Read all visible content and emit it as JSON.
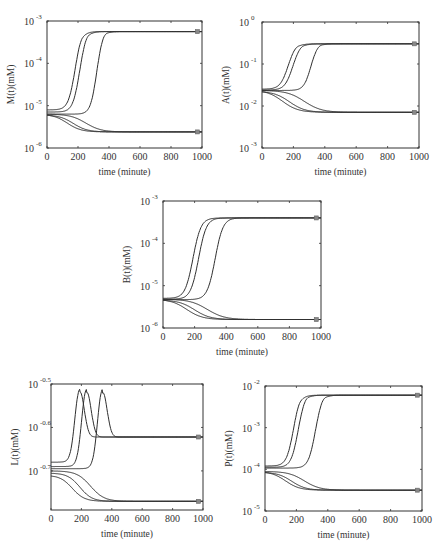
{
  "figure": {
    "width": 439,
    "height": 554,
    "line_color": "#2f2f2f",
    "marker_color": "#888888"
  },
  "chart_data": [
    {
      "id": "M",
      "type": "line",
      "title": "",
      "xlabel": "time (minute)",
      "ylabel": "M(t)(mM)",
      "yscale": "log",
      "xlim": [
        0,
        1000
      ],
      "ylim_log10": [
        -6,
        -3
      ],
      "xticks": [
        0,
        200,
        400,
        600,
        800,
        1000
      ],
      "yticks": [
        {
          "base": "10",
          "exp": "-6",
          "v": -6
        },
        {
          "base": "10",
          "exp": "-5",
          "v": -5
        },
        {
          "base": "10",
          "exp": "-4",
          "v": -4
        },
        {
          "base": "10",
          "exp": "-3",
          "v": -3
        }
      ],
      "box": {
        "x0": 47,
        "y0": 21,
        "x1": 202,
        "y1": 148
      },
      "steady_states_log10": [
        -3.25,
        -5.62
      ],
      "series": [
        {
          "name": "rise-1",
          "start": -5.1,
          "end": -3.25,
          "t_mid": 180,
          "width": 22,
          "overshoot": 0.04,
          "ov_t": 215
        },
        {
          "name": "rise-2",
          "start": -5.15,
          "end": -3.25,
          "t_mid": 210,
          "width": 22,
          "overshoot": 0.04,
          "ov_t": 255
        },
        {
          "name": "rise-3",
          "start": -5.2,
          "end": -3.25,
          "t_mid": 320,
          "width": 20,
          "overshoot": 0.04,
          "ov_t": 370
        },
        {
          "name": "fall-1",
          "start": -5.2,
          "end": -5.62,
          "t_mid": 130,
          "width": 45,
          "overshoot": 0,
          "ov_t": 0
        },
        {
          "name": "fall-2",
          "start": -5.22,
          "end": -5.62,
          "t_mid": 170,
          "width": 45,
          "overshoot": 0,
          "ov_t": 0
        },
        {
          "name": "fall-3",
          "start": -5.2,
          "end": -5.62,
          "t_mid": 250,
          "width": 50,
          "overshoot": 0,
          "ov_t": 0
        }
      ],
      "markers": [
        {
          "t": 970,
          "log10": -3.25
        },
        {
          "t": 970,
          "log10": -5.62
        }
      ]
    },
    {
      "id": "A",
      "type": "line",
      "title": "",
      "xlabel": "time (minute)",
      "ylabel": "A(t)(mM)",
      "yscale": "log",
      "xlim": [
        0,
        1000
      ],
      "ylim_log10": [
        -3,
        0
      ],
      "xticks": [
        0,
        200,
        400,
        600,
        800,
        1000
      ],
      "yticks": [
        {
          "base": "10",
          "exp": "-3",
          "v": -3
        },
        {
          "base": "10",
          "exp": "-2",
          "v": -2
        },
        {
          "base": "10",
          "exp": "-1",
          "v": -1
        },
        {
          "base": "10",
          "exp": "0",
          "v": 0
        }
      ],
      "box": {
        "x0": 262,
        "y0": 22,
        "x1": 419,
        "y1": 148
      },
      "steady_states_log10": [
        -0.52,
        -2.15
      ],
      "series": [
        {
          "name": "rise-1",
          "start": -1.6,
          "end": -0.52,
          "t_mid": 165,
          "width": 25,
          "overshoot": 0.02,
          "ov_t": 215
        },
        {
          "name": "rise-2",
          "start": -1.62,
          "end": -0.52,
          "t_mid": 195,
          "width": 25,
          "overshoot": 0.02,
          "ov_t": 250
        },
        {
          "name": "rise-3",
          "start": -1.63,
          "end": -0.52,
          "t_mid": 310,
          "width": 22,
          "overshoot": 0.02,
          "ov_t": 365
        },
        {
          "name": "fall-1",
          "start": -1.62,
          "end": -2.15,
          "t_mid": 130,
          "width": 50,
          "overshoot": 0,
          "ov_t": 0
        },
        {
          "name": "fall-2",
          "start": -1.65,
          "end": -2.15,
          "t_mid": 175,
          "width": 50,
          "overshoot": 0,
          "ov_t": 0
        },
        {
          "name": "fall-3",
          "start": -1.63,
          "end": -2.15,
          "t_mid": 270,
          "width": 55,
          "overshoot": 0,
          "ov_t": 0
        }
      ],
      "markers": [
        {
          "t": 970,
          "log10": -0.52
        },
        {
          "t": 970,
          "log10": -2.15
        }
      ]
    },
    {
      "id": "B",
      "type": "line",
      "title": "",
      "xlabel": "time (minute)",
      "ylabel": "B(t)(mM)",
      "yscale": "log",
      "xlim": [
        0,
        1000
      ],
      "ylim_log10": [
        -6,
        -3
      ],
      "xticks": [
        0,
        200,
        400,
        600,
        800,
        1000
      ],
      "yticks": [
        {
          "base": "10",
          "exp": "-6",
          "v": -6
        },
        {
          "base": "10",
          "exp": "-5",
          "v": -5
        },
        {
          "base": "10",
          "exp": "-4",
          "v": -4
        },
        {
          "base": "10",
          "exp": "-3",
          "v": -3
        }
      ],
      "box": {
        "x0": 163,
        "y0": 201,
        "x1": 321,
        "y1": 328
      },
      "steady_states_log10": [
        -3.4,
        -5.8
      ],
      "series": [
        {
          "name": "rise-1",
          "start": -5.3,
          "end": -3.4,
          "t_mid": 190,
          "width": 25,
          "overshoot": 0,
          "ov_t": 0
        },
        {
          "name": "rise-2",
          "start": -5.32,
          "end": -3.4,
          "t_mid": 225,
          "width": 25,
          "overshoot": 0,
          "ov_t": 0
        },
        {
          "name": "rise-3",
          "start": -5.33,
          "end": -3.4,
          "t_mid": 330,
          "width": 25,
          "overshoot": 0,
          "ov_t": 0
        },
        {
          "name": "fall-1",
          "start": -5.32,
          "end": -5.8,
          "t_mid": 150,
          "width": 50,
          "overshoot": 0,
          "ov_t": 0
        },
        {
          "name": "fall-2",
          "start": -5.34,
          "end": -5.8,
          "t_mid": 200,
          "width": 50,
          "overshoot": 0,
          "ov_t": 0
        },
        {
          "name": "fall-3",
          "start": -5.32,
          "end": -5.8,
          "t_mid": 280,
          "width": 55,
          "overshoot": 0,
          "ov_t": 0
        }
      ],
      "markers": [
        {
          "t": 970,
          "log10": -3.4
        },
        {
          "t": 970,
          "log10": -5.8
        }
      ]
    },
    {
      "id": "L",
      "type": "line",
      "title": "",
      "xlabel": "time (minute)",
      "ylabel": "L(t)(mM)",
      "yscale": "log",
      "xlim": [
        0,
        1000
      ],
      "ylim_log10": [
        -0.79,
        -0.5
      ],
      "xticks": [
        0,
        200,
        400,
        600,
        800,
        1000
      ],
      "yticks": [
        {
          "base": "10",
          "exp": "-0.7",
          "v": -0.7
        },
        {
          "base": "10",
          "exp": "-0.6",
          "v": -0.6
        },
        {
          "base": "10",
          "exp": "-0.5",
          "v": -0.5
        }
      ],
      "box": {
        "x0": 51,
        "y0": 384,
        "x1": 203,
        "y1": 510
      },
      "steady_states_log10": [
        -0.622,
        -0.77
      ],
      "series": [
        {
          "name": "pulse-1",
          "start": -0.68,
          "end": -0.622,
          "t_mid": 190,
          "width": 40,
          "peak": -0.512,
          "kind": "pulse"
        },
        {
          "name": "pulse-2",
          "start": -0.69,
          "end": -0.622,
          "t_mid": 235,
          "width": 40,
          "peak": -0.512,
          "kind": "pulse"
        },
        {
          "name": "pulse-3",
          "start": -0.695,
          "end": -0.622,
          "t_mid": 340,
          "width": 40,
          "peak": -0.512,
          "kind": "pulse"
        },
        {
          "name": "fall-1",
          "start": -0.71,
          "end": -0.77,
          "t_mid": 140,
          "width": 40,
          "kind": "sigmoid"
        },
        {
          "name": "fall-2",
          "start": -0.705,
          "end": -0.77,
          "t_mid": 190,
          "width": 40,
          "kind": "sigmoid"
        },
        {
          "name": "fall-3",
          "start": -0.7,
          "end": -0.77,
          "t_mid": 260,
          "width": 45,
          "kind": "sigmoid"
        }
      ],
      "markers": [
        {
          "t": 970,
          "log10": -0.622
        },
        {
          "t": 970,
          "log10": -0.77
        }
      ]
    },
    {
      "id": "P",
      "type": "line",
      "title": "",
      "xlabel": "time (minute)",
      "ylabel": "P(t)(mM)",
      "yscale": "log",
      "xlim": [
        0,
        1000
      ],
      "ylim_log10": [
        -5,
        -2
      ],
      "xticks": [
        0,
        200,
        400,
        600,
        800,
        1000
      ],
      "yticks": [
        {
          "base": "10",
          "exp": "-5",
          "v": -5
        },
        {
          "base": "10",
          "exp": "-4",
          "v": -4
        },
        {
          "base": "10",
          "exp": "-3",
          "v": -3
        },
        {
          "base": "10",
          "exp": "-2",
          "v": -2
        }
      ],
      "box": {
        "x0": 265,
        "y0": 386,
        "x1": 422,
        "y1": 511
      },
      "steady_states_log10": [
        -2.22,
        -4.5
      ],
      "series": [
        {
          "name": "rise-1",
          "start": -3.92,
          "end": -2.22,
          "t_mid": 180,
          "width": 22,
          "overshoot": 0.04,
          "ov_t": 215
        },
        {
          "name": "rise-2",
          "start": -3.95,
          "end": -2.22,
          "t_mid": 210,
          "width": 22,
          "overshoot": 0.04,
          "ov_t": 260
        },
        {
          "name": "rise-3",
          "start": -3.97,
          "end": -2.22,
          "t_mid": 320,
          "width": 22,
          "overshoot": 0.04,
          "ov_t": 370
        },
        {
          "name": "fall-1",
          "start": -4.05,
          "end": -4.5,
          "t_mid": 130,
          "width": 45,
          "overshoot": 0,
          "ov_t": 0
        },
        {
          "name": "fall-2",
          "start": -4.07,
          "end": -4.5,
          "t_mid": 170,
          "width": 45,
          "overshoot": 0,
          "ov_t": 0
        },
        {
          "name": "fall-3",
          "start": -4.05,
          "end": -4.5,
          "t_mid": 250,
          "width": 50,
          "overshoot": 0,
          "ov_t": 0
        }
      ],
      "markers": [
        {
          "t": 970,
          "log10": -2.22
        },
        {
          "t": 970,
          "log10": -4.5
        }
      ]
    }
  ]
}
